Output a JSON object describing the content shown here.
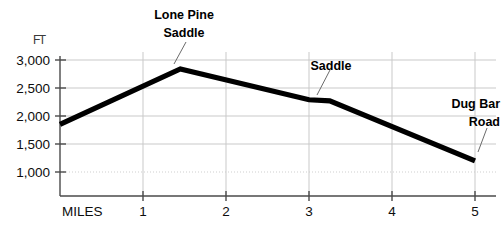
{
  "chart_data": {
    "type": "line",
    "title": "",
    "subtitle": "",
    "xlabel": "MILES",
    "ylabel": "FT",
    "xlim": [
      0,
      5
    ],
    "ylim": [
      750,
      3000
    ],
    "grid": true,
    "legend_position": "none",
    "x_ticks": [
      "1",
      "2",
      "3",
      "4",
      "5"
    ],
    "x_tick_values": [
      1,
      2,
      3,
      4,
      5
    ],
    "y_ticks": [
      "1,000",
      "1,500",
      "2,000",
      "2,500",
      "3,000"
    ],
    "y_tick_values": [
      1000,
      1500,
      2000,
      2500,
      3000
    ],
    "series": [
      {
        "name": "Elevation profile",
        "x": [
          0,
          1.45,
          3.0,
          3.25,
          5.0
        ],
        "values": [
          1850,
          2840,
          2290,
          2270,
          1200
        ]
      }
    ],
    "annotations": [
      {
        "label": "Lone Pine\nSaddle",
        "line1": "Lone Pine",
        "line2": "Saddle",
        "x": 1.45,
        "y": 2840
      },
      {
        "label": "Saddle",
        "line1": "Saddle",
        "line2": "",
        "x": 3.15,
        "y": 2280
      },
      {
        "label": "Dug Bar\nRoad",
        "line1": "Dug Bar",
        "line2": "Road",
        "x": 5.0,
        "y": 1200
      }
    ]
  },
  "axes": {
    "unit_label": "FT",
    "x_axis_name": "MILES",
    "y_tick_1": "1,000",
    "y_tick_2": "1,500",
    "y_tick_3": "2,000",
    "y_tick_4": "2,500",
    "y_tick_5": "3,000",
    "x_tick_1": "1",
    "x_tick_2": "2",
    "x_tick_3": "3",
    "x_tick_4": "4",
    "x_tick_5": "5"
  },
  "annotations": {
    "lone_pine_line1": "Lone Pine",
    "lone_pine_line2": "Saddle",
    "saddle": "Saddle",
    "dug_bar_line1": "Dug Bar",
    "dug_bar_line2": "Road"
  },
  "colors": {
    "background": "#ffffff",
    "profile_line": "#000000",
    "gridline": "#c9c9c9",
    "axis": "#4a4a4a",
    "text": "#0d0d0d",
    "leader": "#6b6b6b"
  }
}
